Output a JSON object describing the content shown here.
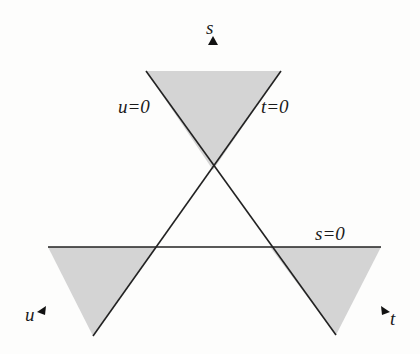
{
  "diagram": {
    "colors": {
      "shade": "#d4d4d4",
      "line": "#222222",
      "background": "#fdfdfc"
    },
    "lines": [
      {
        "name": "u=0",
        "label": "u=0",
        "from": [
          146,
          71
        ],
        "to": [
          336,
          335
        ]
      },
      {
        "name": "t=0",
        "label": "t=0",
        "from": [
          281,
          71
        ],
        "to": [
          93,
          336
        ]
      },
      {
        "name": "s=0",
        "label": "s=0",
        "from": [
          48,
          247
        ],
        "to": [
          381,
          247
        ]
      }
    ],
    "shaded_regions": [
      {
        "name": "s-channel",
        "points": [
          [
            146,
            71
          ],
          [
            281,
            71
          ],
          [
            213,
            170
          ]
        ]
      },
      {
        "name": "u-channel",
        "points": [
          [
            48,
            247
          ],
          [
            157,
            247
          ],
          [
            93,
            336
          ]
        ]
      },
      {
        "name": "t-channel",
        "points": [
          [
            270,
            247
          ],
          [
            381,
            247
          ],
          [
            336,
            335
          ]
        ]
      }
    ],
    "labels": {
      "u_line": "u=0",
      "t_line": "t=0",
      "s_line": "s=0",
      "s_axis": "s",
      "u_axis": "u",
      "t_axis": "t"
    },
    "arrows": [
      {
        "name": "s-axis-arrow",
        "direction": "up",
        "at": [
          213,
          43
        ]
      },
      {
        "name": "u-axis-arrow",
        "direction": "up-right",
        "at": [
          42,
          311
        ]
      },
      {
        "name": "t-axis-arrow",
        "direction": "up-left",
        "at": [
          386,
          311
        ]
      }
    ]
  }
}
